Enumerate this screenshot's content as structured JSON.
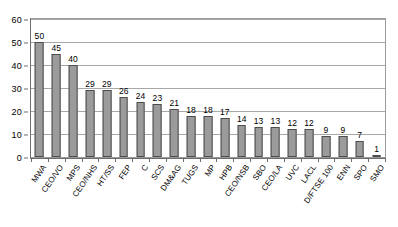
{
  "chart_data": {
    "type": "bar",
    "title": "",
    "subtitle": "",
    "xlabel": "",
    "ylabel": "",
    "ylim": [
      0,
      60
    ],
    "yticks": [
      0,
      10,
      20,
      30,
      40,
      50,
      60
    ],
    "grid": true,
    "legend": null,
    "categories": [
      "MWA",
      "CEO/VO",
      "MPS",
      "CEO/NHS",
      "HT/SS",
      "FEP",
      "C",
      "SCS",
      "DM&AG",
      "TUGS",
      "MP",
      "HPB",
      "CEO/NSB",
      "SBO",
      "CEO/LA",
      "UVC",
      "LACL",
      "D/FTSE 100",
      "ENN",
      "SPO",
      "SMO"
    ],
    "values": [
      50,
      45,
      40,
      29,
      29,
      26,
      24,
      23,
      21,
      18,
      18,
      17,
      14,
      13,
      13,
      12,
      12,
      9,
      9,
      7,
      1
    ],
    "bar_fill_color": "#9b9b9b",
    "bar_border_color": "#4d4d4d",
    "gridline_color": "#a8a8a8",
    "axis_color": "#6d6d6d",
    "background_color": "#ffffff"
  }
}
